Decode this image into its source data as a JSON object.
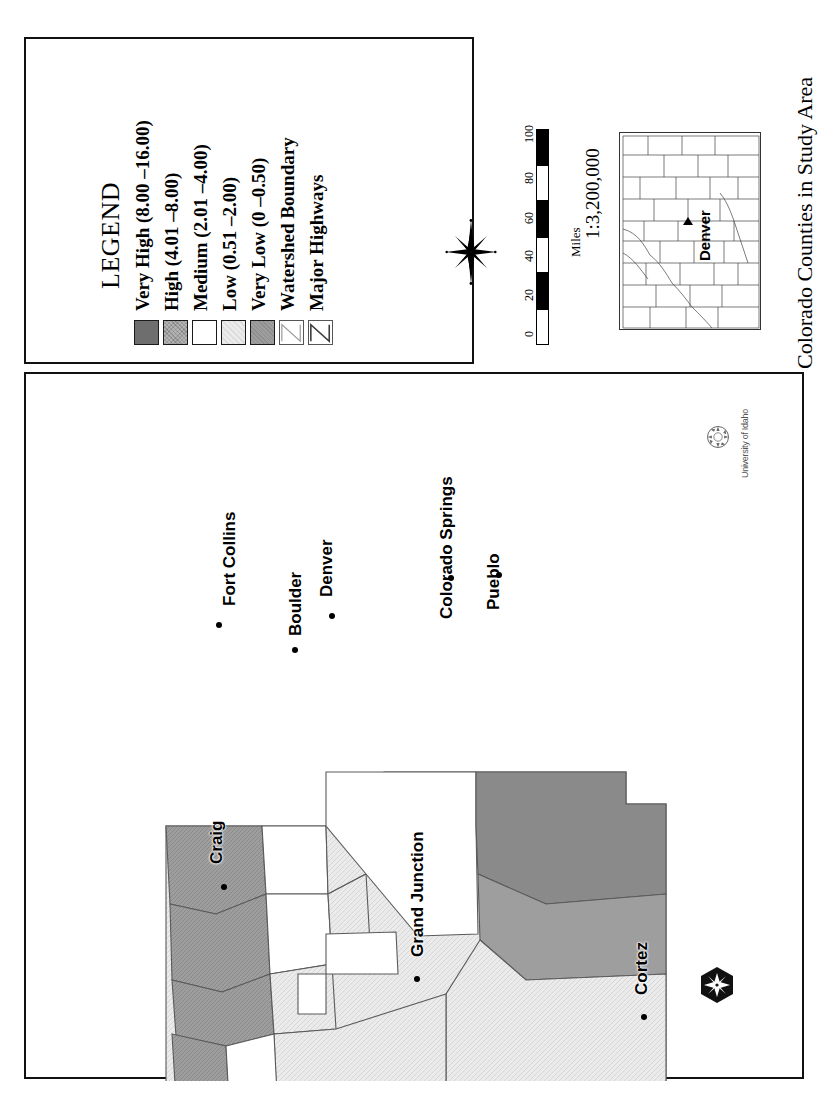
{
  "document": {
    "type": "map-figure",
    "orientation": "rotated-90-ccw"
  },
  "legend": {
    "title": "LEGEND",
    "classes": [
      {
        "label": "Very High (8.00 –16.00)",
        "color": "#6e6e6e",
        "texture": "solid"
      },
      {
        "label": "High (4.01 –8.00)",
        "color": "#b4b4b4",
        "texture": "hatched"
      },
      {
        "label": "Medium (2.01 –4.00)",
        "color": "#ffffff",
        "texture": "solid"
      },
      {
        "label": "Low (0.51 –2.00)",
        "color": "#ebebeb",
        "texture": "light-hatch"
      },
      {
        "label": "Very Low (0 –0.50)",
        "color": "#9e9e9e",
        "texture": "hatched"
      }
    ],
    "line_symbols": [
      {
        "label": "Watershed Boundary",
        "icon": "zigzag-line-icon",
        "color": "#8a8a8a"
      },
      {
        "label": "Major Highways",
        "icon": "zigzag-line-icon",
        "color": "#3a3a3a"
      }
    ]
  },
  "compass": {
    "icon": "compass-rose-icon"
  },
  "scalebar": {
    "unit_label": "Miles",
    "ticks": [
      "0",
      "20",
      "40",
      "60",
      "80",
      "100"
    ],
    "scale_text": "1:3,200,000"
  },
  "inset": {
    "caption": "Colorado Counties in Study Area",
    "city_label": "Denver",
    "city_marker": "triangle-marker"
  },
  "map": {
    "cities": [
      {
        "name": "Fort Collins",
        "x": 218,
        "y": 604,
        "dot_x": 214,
        "dot_y": 620
      },
      {
        "name": "Boulder",
        "x": 284,
        "y": 634,
        "dot_x": 290,
        "dot_y": 645
      },
      {
        "name": "Denver",
        "x": 315,
        "y": 595,
        "dot_x": 327,
        "dot_y": 611
      },
      {
        "name": "Colorado Springs",
        "x": 435,
        "y": 617,
        "dot_x": 446,
        "dot_y": 573
      },
      {
        "name": "Pueblo",
        "x": 482,
        "y": 608,
        "dot_x": 494,
        "dot_y": 570
      },
      {
        "name": "Craig",
        "x": 205,
        "y": 862,
        "dot_x": 219,
        "dot_y": 882
      },
      {
        "name": "Grand Junction",
        "x": 406,
        "y": 955,
        "dot_x": 412,
        "dot_y": 974
      },
      {
        "name": "Cortez",
        "x": 630,
        "y": 993,
        "dot_x": 639,
        "dot_y": 1012
      }
    ]
  },
  "logos": {
    "university": {
      "name": "university-of-idaho-logo",
      "text": "University of Idaho"
    },
    "agency": {
      "name": "hexagon-compass-logo"
    }
  },
  "colors": {
    "very_high": "#6e6e6e",
    "high": "#b4b4b4",
    "medium": "#ffffff",
    "low": "#ebebeb",
    "very_low": "#9e9e9e",
    "boundary": "#555555",
    "highway": "#7a7a7a",
    "frame": "#111111"
  }
}
